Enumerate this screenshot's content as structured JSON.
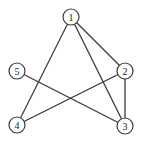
{
  "diagram": {
    "type": "undirected-graph",
    "node_radius": 8,
    "colors": {
      "stroke": "#3a3a3a",
      "fill": "#ffffff",
      "label": "#222222"
    },
    "nodes": [
      {
        "id": "1",
        "label": "1",
        "x": 71,
        "y": 17
      },
      {
        "id": "2",
        "label": "2",
        "x": 125,
        "y": 71
      },
      {
        "id": "3",
        "label": "3",
        "x": 125,
        "y": 126
      },
      {
        "id": "4",
        "label": "4",
        "x": 17,
        "y": 125
      },
      {
        "id": "5",
        "label": "5",
        "x": 17,
        "y": 71
      }
    ],
    "edges": [
      {
        "from": "1",
        "to": "4"
      },
      {
        "from": "1",
        "to": "3"
      },
      {
        "from": "1",
        "to": "2"
      },
      {
        "from": "2",
        "to": "3"
      },
      {
        "from": "2",
        "to": "4"
      },
      {
        "from": "5",
        "to": "3"
      }
    ]
  }
}
